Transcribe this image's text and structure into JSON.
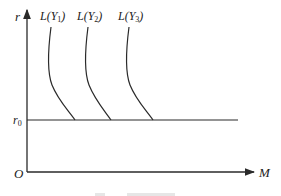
{
  "diagram": {
    "type": "liquidity-trap money demand diagram",
    "axes": {
      "y_label": "r",
      "x_label": "M",
      "origin_label": "O"
    },
    "reference_line": {
      "label": "r",
      "label_sub": "0"
    },
    "curves": [
      {
        "label": "L(Y",
        "sub": "1",
        "close": ")"
      },
      {
        "label": "L(Y",
        "sub": "2",
        "close": ")"
      },
      {
        "label": "L(Y",
        "sub": "3",
        "close": ")"
      }
    ],
    "caption": {
      "visible": "clipped at bottom edge, unreadable"
    },
    "colors": {
      "line": "#2a2a2a",
      "text": "#222222",
      "background": "#ffffff"
    }
  }
}
